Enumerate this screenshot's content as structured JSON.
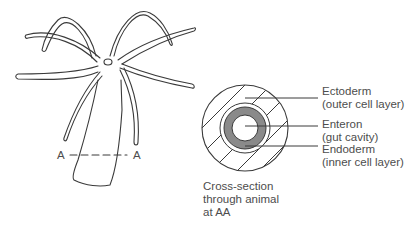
{
  "diagram": {
    "section_markers": {
      "left": "A",
      "right": "A"
    },
    "labels": [
      {
        "id": "ectoderm",
        "name": "Ectoderm",
        "detail": "(outer cell layer)"
      },
      {
        "id": "enteron",
        "name": "Enteron",
        "detail": "(gut cavity)"
      },
      {
        "id": "endoderm",
        "name": "Endoderm",
        "detail": "(inner cell layer)"
      }
    ],
    "caption": [
      "Cross-section",
      "through animal",
      "at AA"
    ],
    "colors": {
      "line": "#3a3a3a",
      "endoderm_fill": "#8a8a8a",
      "text": "#4d4d4d"
    }
  }
}
